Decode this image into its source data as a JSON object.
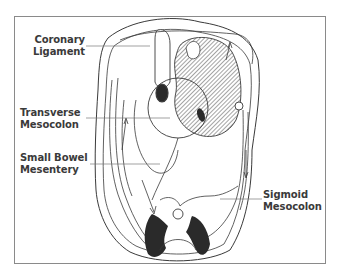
{
  "figure": {
    "labels": {
      "coronary_ligament": [
        "Coronary",
        "Ligament"
      ],
      "transverse_mesocolon": [
        "Transverse",
        "Mesocolon"
      ],
      "small_bowel_mesentery": [
        "Small Bowel",
        "Mesentery"
      ],
      "sigmoid_mesocolon": [
        "Sigmoid",
        "Mesocolon"
      ]
    },
    "colors": {
      "line": "#3a3a3a",
      "frame": "#8a8a8a",
      "hatch": "#4a4a4a",
      "solid_fill": "#2a2a2a",
      "background": "#ffffff"
    }
  }
}
